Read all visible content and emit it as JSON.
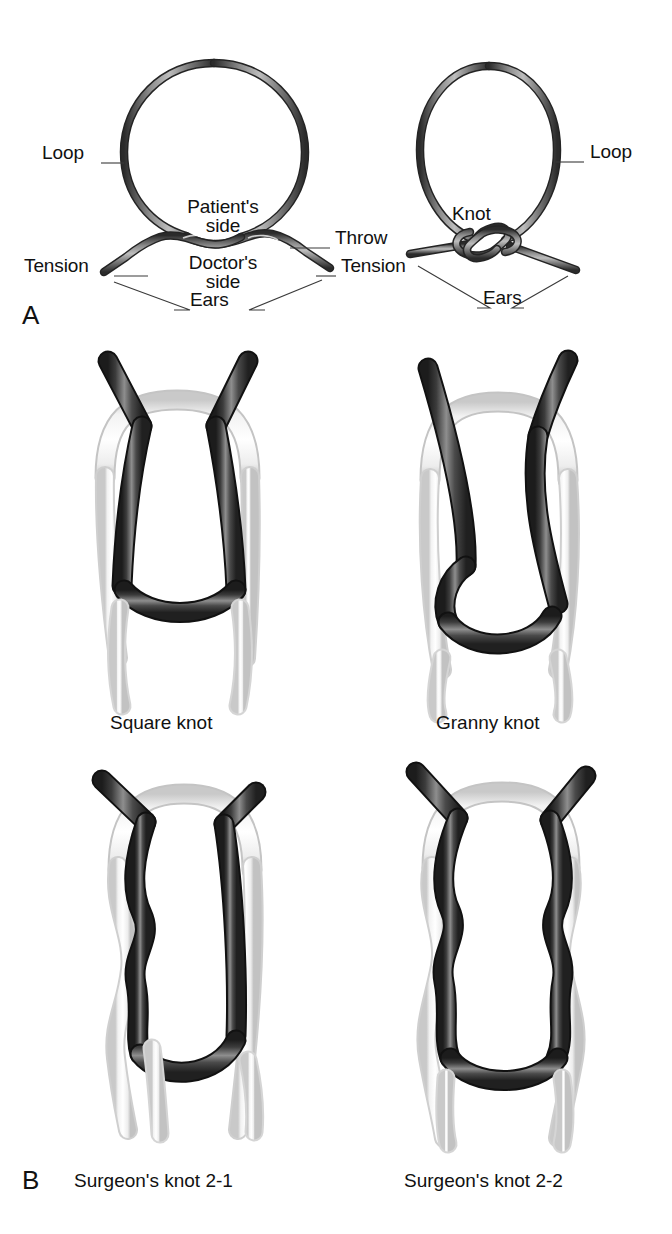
{
  "figure": {
    "background_color": "#ffffff",
    "ink_color": "#111111",
    "strand_dark_color": "#4a4a4a",
    "strand_dark_edge": "#1a1a1a",
    "strand_light_color": "#ffffff",
    "strand_light_edge": "#d8d8d8"
  },
  "panel_a": {
    "letter": "A",
    "left_diagram": {
      "name": "single-throw-diagram",
      "labels": {
        "loop": "Loop",
        "patients_side": "Patient's\nside",
        "patients_side_line1": "Patient's",
        "patients_side_line2": "side",
        "doctors_side_line1": "Doctor's",
        "doctors_side_line2": "side",
        "tension_left": "Tension",
        "throw": "Throw",
        "tension_right": "Tension",
        "ears": "Ears"
      }
    },
    "right_diagram": {
      "name": "completed-knot-diagram",
      "labels": {
        "loop": "Loop",
        "knot": "Knot",
        "ears": "Ears"
      }
    }
  },
  "panel_b": {
    "letter": "B",
    "knots": [
      {
        "name": "square-knot",
        "caption": "Square knot"
      },
      {
        "name": "granny-knot",
        "caption": "Granny knot"
      },
      {
        "name": "surgeons-knot-2-1",
        "caption": "Surgeon's knot 2-1"
      },
      {
        "name": "surgeons-knot-2-2",
        "caption": "Surgeon's knot 2-2"
      }
    ]
  }
}
